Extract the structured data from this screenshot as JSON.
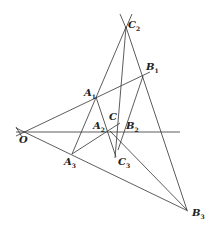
{
  "figure": {
    "points": {
      "O": {
        "label": "O",
        "sub": ""
      },
      "A1": {
        "label": "A",
        "sub": "1"
      },
      "A2": {
        "label": "A",
        "sub": "2"
      },
      "A3": {
        "label": "A",
        "sub": "3"
      },
      "B1": {
        "label": "B",
        "sub": "1"
      },
      "B2": {
        "label": "B",
        "sub": "2"
      },
      "B3": {
        "label": "B",
        "sub": "3"
      },
      "C": {
        "label": "C",
        "sub": ""
      },
      "C2": {
        "label": "C",
        "sub": "2"
      },
      "C3": {
        "label": "C",
        "sub": "3"
      }
    },
    "line_color": "#333333"
  }
}
